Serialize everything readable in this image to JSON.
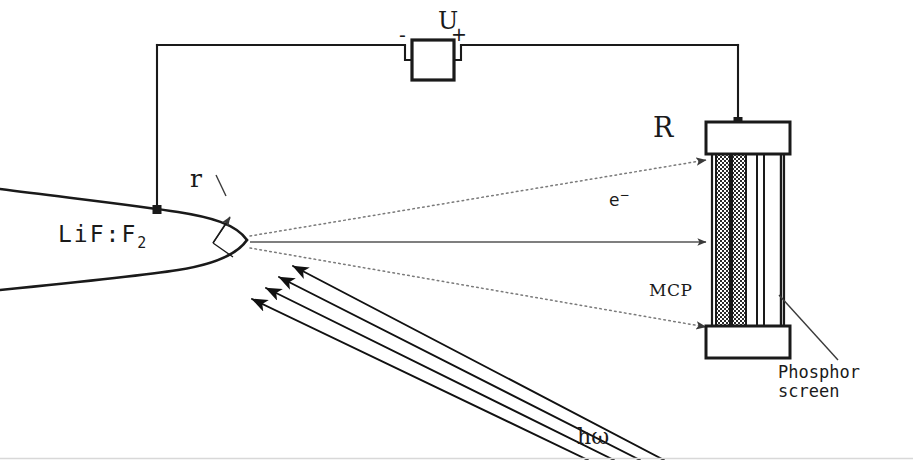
{
  "figure": {
    "background_color": "#ffffff",
    "ink_color": "#1a1a1a",
    "width": 913,
    "height": 460
  },
  "labels": {
    "crystal": "LiF:F",
    "crystal_subscript": "2",
    "tip_radius": "r",
    "voltage": "U",
    "polarity_negative": "-",
    "polarity_positive": "+",
    "detector_radius": "R",
    "electron": "e",
    "electron_superscript": "−",
    "mcp": "MCP",
    "phosphor_line1": "Phosphor",
    "phosphor_line2": "screen",
    "photon": "hω"
  },
  "components": {
    "crystal": {
      "name": "LiF:F2 field-emitter tip",
      "shape": "tapered cone with rounded apex",
      "apex_x": 247,
      "apex_y": 240
    },
    "power_supply": {
      "name": "DC high-voltage source",
      "symbol": "square box in circuit",
      "box_x": 412,
      "box_y": 40,
      "box_w": 42,
      "box_h": 40
    },
    "detector": {
      "name": "microchannel plate stack with phosphor screen",
      "left": 712,
      "top": 122,
      "width": 72,
      "height": 234,
      "cap_height": 34,
      "mcp_plates": 2,
      "phosphor_screen_lines": 2
    },
    "wiring": {
      "left_drop_x": 157,
      "top_rail_y": 45,
      "right_drop_x": 738,
      "tip_terminal_y": 210,
      "detector_terminal_y": 122
    }
  },
  "trajectories": {
    "style": "dotted",
    "count": 3,
    "description": "electron trajectories fanning from tip apex to MCP front face",
    "center_line": "solid axis from apex to MCP"
  },
  "light_beam": {
    "style": "solid arrows",
    "count": 4,
    "direction": "lower-right to upper-left, pointing at the crystal tip",
    "description": "incident laser excitation beam hω"
  }
}
